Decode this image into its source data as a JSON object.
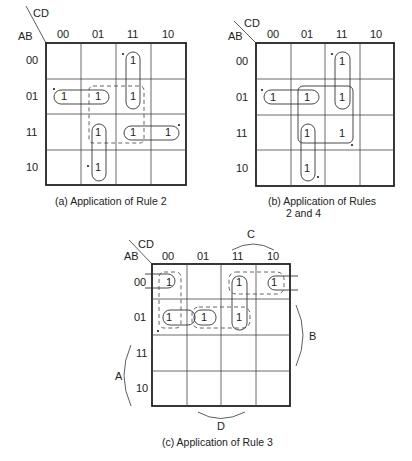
{
  "maps": [
    {
      "id": "a",
      "row_var": "AB",
      "col_var": "CD",
      "col_labels": [
        "00",
        "01",
        "11",
        "10"
      ],
      "row_labels": [
        "00",
        "01",
        "11",
        "10"
      ],
      "caption": "(a) Application of Rule 2",
      "ones": [
        [
          0,
          2
        ],
        [
          1,
          0
        ],
        [
          1,
          1
        ],
        [
          1,
          2
        ],
        [
          2,
          1
        ],
        [
          2,
          2
        ],
        [
          2,
          3
        ],
        [
          3,
          1
        ]
      ]
    },
    {
      "id": "b",
      "row_var": "AB",
      "col_var": "CD",
      "col_labels": [
        "00",
        "01",
        "11",
        "10"
      ],
      "row_labels": [
        "00",
        "01",
        "11",
        "10"
      ],
      "caption_line1": "(b) Application of Rules",
      "caption_line2": "2 and 4",
      "ones": [
        [
          0,
          2
        ],
        [
          1,
          0
        ],
        [
          1,
          1
        ],
        [
          1,
          2
        ],
        [
          2,
          1
        ],
        [
          2,
          2
        ],
        [
          3,
          1
        ]
      ]
    },
    {
      "id": "c",
      "row_var": "AB",
      "col_var": "CD",
      "col_labels": [
        "00",
        "01",
        "11",
        "10"
      ],
      "row_labels": [
        "00",
        "01",
        "11",
        "10"
      ],
      "caption": "(c) Application of Rule 3",
      "brackets": {
        "A": "A",
        "B": "B",
        "C": "C",
        "D": "D"
      },
      "ones": [
        [
          0,
          0
        ],
        [
          0,
          2
        ],
        [
          0,
          3
        ],
        [
          1,
          0
        ],
        [
          1,
          1
        ],
        [
          1,
          2
        ]
      ]
    }
  ],
  "cell_value": "1"
}
